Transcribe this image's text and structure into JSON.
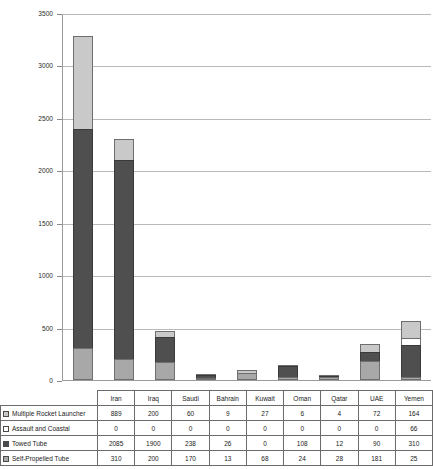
{
  "chart_data": {
    "type": "bar",
    "stacked": true,
    "title": "",
    "xlabel": "",
    "ylabel": "",
    "ylim": [
      0,
      3500
    ],
    "ytick_step": 500,
    "ytick_labels": [
      "3500",
      "3000",
      "2500",
      "2000",
      "1500",
      "1000",
      "500",
      "0"
    ],
    "grid": true,
    "legend_position": "table-row-headers",
    "categories": [
      "Iran",
      "Iraq",
      "Saudi",
      "Bahrain",
      "Kuwait",
      "Oman",
      "Qatar",
      "UAE",
      "Yemen"
    ],
    "series": [
      {
        "name": "Multiple Rocket Launcher",
        "color": "#c9c9c9",
        "swatch": "sw-mrl",
        "values": [
          889,
          200,
          60,
          9,
          27,
          6,
          4,
          72,
          164
        ]
      },
      {
        "name": "Assault and Coastal",
        "color": "#ffffff",
        "swatch": "sw-assault",
        "values": [
          0,
          0,
          0,
          0,
          0,
          0,
          0,
          0,
          66
        ]
      },
      {
        "name": "Towed Tube",
        "color": "#4f4f4f",
        "swatch": "sw-towed",
        "values": [
          2085,
          1900,
          238,
          26,
          0,
          108,
          12,
          90,
          310
        ]
      },
      {
        "name": "Self-Propelled Tube",
        "color": "#a8a8a8",
        "swatch": "sw-self",
        "values": [
          310,
          200,
          170,
          13,
          68,
          24,
          28,
          181,
          25
        ]
      }
    ],
    "totals": [
      3284,
      2300,
      468,
      48,
      95,
      138,
      44,
      343,
      565
    ]
  },
  "table": {
    "corner_label": "",
    "column_headers": [
      "Iran",
      "Iraq",
      "Saudi",
      "Bahrain",
      "Kuwait",
      "Oman",
      "Qatar",
      "UAE",
      "Yemen"
    ],
    "rows": [
      {
        "label": "Multiple Rocket Launcher",
        "swatch": "sw-mrl",
        "cells": [
          "889",
          "200",
          "60",
          "9",
          "27",
          "6",
          "4",
          "72",
          "164"
        ]
      },
      {
        "label": "Assault and Coastal",
        "swatch": "sw-assault",
        "cells": [
          "0",
          "0",
          "0",
          "0",
          "0",
          "0",
          "0",
          "0",
          "66"
        ]
      },
      {
        "label": "Towed Tube",
        "swatch": "sw-towed",
        "cells": [
          "2085",
          "1900",
          "238",
          "26",
          "0",
          "108",
          "12",
          "90",
          "310"
        ]
      },
      {
        "label": "Self-Propelled Tube",
        "swatch": "sw-self",
        "cells": [
          "310",
          "200",
          "170",
          "13",
          "68",
          "24",
          "28",
          "181",
          "25"
        ]
      }
    ]
  },
  "colors": {
    "mrl": "#c9c9c9",
    "assault": "#ffffff",
    "towed": "#4f4f4f",
    "self_propelled": "#a8a8a8",
    "gridline": "#b9b9b9",
    "axis": "#9a9a9a",
    "border": "#6b6b6b"
  }
}
